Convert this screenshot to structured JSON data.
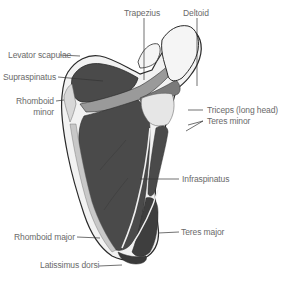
{
  "diagram": {
    "colors": {
      "muscle_dark": "#4a4a4a",
      "muscle_light": "#9a9a9a",
      "bone": "#f2f2f2",
      "outline": "#2a2a2a",
      "leader_line": "#333333",
      "label_text": "#6a6a6a"
    },
    "labels": {
      "trapezius": "Trapezius",
      "deltoid": "Deltoid",
      "levator_scapulae": "Levator scapulae",
      "supraspinatus": "Supraspinatus",
      "rhomboid_minor_1": "Rhomboid",
      "rhomboid_minor_2": "minor",
      "triceps_long_head": "Triceps (long head)",
      "teres_minor": "Teres minor",
      "infraspinatus": "Infraspinatus",
      "rhomboid_major": "Rhomboid major",
      "teres_major": "Teres major",
      "latissimus_dorsi": "Latissimus dorsi"
    }
  }
}
